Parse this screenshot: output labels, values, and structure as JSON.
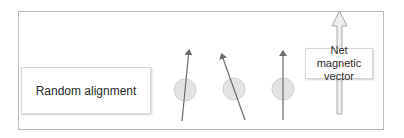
{
  "diagram": {
    "labels": {
      "random_alignment": "Random alignment",
      "net_vector": "Net magnetic vector"
    },
    "colors": {
      "frame_border": "#b9b9b9",
      "arrow": "#6b6b6b",
      "circle_fill": "#e3e3e3",
      "circle_stroke": "#d0d0d0",
      "net_arrow_fill": "#eeeeee",
      "net_arrow_stroke": "#a9a9a9"
    },
    "spins": [
      {
        "circle": {
          "cx": 185,
          "cy": 90,
          "r": 11
        },
        "arrow": {
          "x1": 182,
          "y1": 121,
          "x2": 189,
          "y2": 49
        },
        "orientation": "slightly-right"
      },
      {
        "circle": {
          "cx": 234,
          "cy": 89,
          "r": 11
        },
        "arrow": {
          "x1": 245,
          "y1": 120,
          "x2": 221,
          "y2": 53
        },
        "orientation": "tilted-left"
      },
      {
        "circle": {
          "cx": 283,
          "cy": 89,
          "r": 11
        },
        "arrow": {
          "x1": 283,
          "y1": 120,
          "x2": 283,
          "y2": 50
        },
        "orientation": "vertical"
      }
    ],
    "net_arrow": {
      "x": 339,
      "y_bottom": 114,
      "y_top": 11
    }
  }
}
